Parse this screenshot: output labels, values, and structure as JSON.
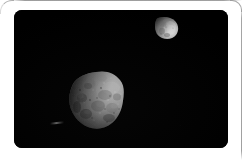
{
  "viewer": {
    "name": "image-viewer-card",
    "background_color": "#ffffff",
    "frame_border_color": "#969696",
    "width_px": 245,
    "height_px": 164
  },
  "photo": {
    "name": "astronomy-photograph",
    "background_color": "#000000",
    "corner_radius_px": 8,
    "left_px": 14,
    "top_px": 10,
    "width_px": 214,
    "height_px": 138,
    "subjects": [
      {
        "id": "large-moon",
        "icon": "moon-large-icon",
        "center_x_px": 82,
        "center_y_px": 90,
        "radius_px": 27,
        "bright_limb": "upper-right",
        "shadow_limb": "left",
        "peak_gray": "#c9c9c9",
        "mid_gray": "#8a8a8a",
        "dark_gray": "#2a2a2a"
      },
      {
        "id": "small-moon",
        "icon": "moon-small-icon",
        "center_x_px": 153,
        "center_y_px": 17,
        "radius_px": 11,
        "bright_limb": "lower-right",
        "shadow_limb": "upper-left",
        "peak_gray": "#dcdcdc",
        "mid_gray": "#979797",
        "dark_gray": "#303030"
      }
    ]
  }
}
